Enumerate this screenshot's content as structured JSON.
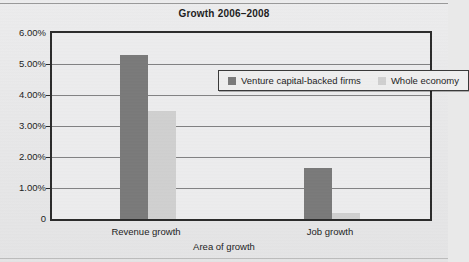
{
  "chart_data": {
    "type": "bar",
    "title": "Growth 2006–2008",
    "xlabel": "Area of growth",
    "ylabel": "",
    "categories": [
      "Revenue growth",
      "Job growth"
    ],
    "series": [
      {
        "name": "Venture capital-backed firms",
        "values": [
          5.3,
          1.65
        ],
        "color": "#7a7a7a"
      },
      {
        "name": "Whole economy",
        "values": [
          3.5,
          0.2
        ],
        "color": "#d0d0d0"
      }
    ],
    "ylim": [
      0,
      6
    ],
    "ytick_values": [
      6,
      5,
      4,
      3,
      2,
      1,
      0
    ],
    "ytick_labels": [
      "6.00%",
      "5.00%",
      "4.00%",
      "3.00%",
      "2.00%",
      "1.00%",
      "0"
    ],
    "grid": true,
    "legend_position": "upper center inside",
    "value_suffix": "%"
  },
  "styling": {
    "plot_background": "#ececed",
    "page_background": "#e9e9e9",
    "axis_color": "#2b2b2b",
    "gridline_color": "#6f6f6f"
  }
}
